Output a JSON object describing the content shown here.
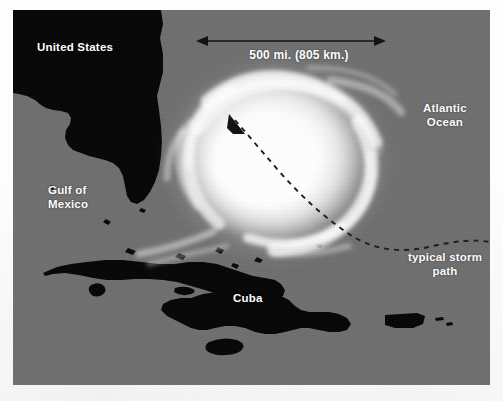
{
  "map": {
    "kind": "satellite-hurricane-map",
    "colors": {
      "ocean": "#6f6f6f",
      "land": "#060606",
      "label_text": "#ffffff",
      "storm_cloud": "#ffffff",
      "track_line": "#1a1a1a",
      "page_background": "#ffffff"
    },
    "labels": {
      "united_states": "United States",
      "gulf_of_mexico": "Gulf of\nMexico",
      "cuba": "Cuba",
      "atlantic_ocean": "Atlantic\nOcean",
      "typical_storm_path": "typical storm\npath"
    },
    "scale": {
      "text": "500 mi. (805 km.)",
      "miles": 500,
      "kilometers": 805,
      "arrow_style": "double-headed"
    },
    "annotations": {
      "storm_motion_arrow": "arrowhead pointing northwest at hurricane center",
      "track_style": "dashed curve"
    },
    "features": [
      "United States (Gulf coast and Florida peninsula)",
      "Gulf of Mexico",
      "Cuba",
      "Jamaica",
      "Hispaniola",
      "Puerto Rico",
      "Atlantic Ocean",
      "Hurricane cloud spiral"
    ]
  }
}
